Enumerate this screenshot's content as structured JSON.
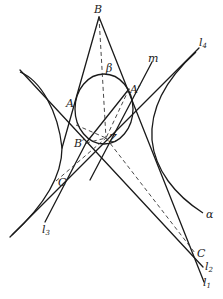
{
  "diagram": {
    "type": "projective-geometry-conic-tangents",
    "points": {
      "B": {
        "label": "B",
        "x": 99,
        "y": 17
      },
      "A": {
        "label": "A",
        "x": 77,
        "y": 103
      },
      "beta": {
        "label": "β",
        "x": 108,
        "y": 74
      },
      "A_prime": {
        "label": "A′",
        "x": 129,
        "y": 89
      },
      "B_prime": {
        "label": "B′",
        "x": 86,
        "y": 143
      },
      "Z": {
        "label": "Z",
        "x": 106,
        "y": 138
      },
      "C_prime": {
        "label": "C′",
        "x": 56,
        "y": 181
      },
      "C": {
        "label": "C",
        "x": 195,
        "y": 253
      }
    },
    "lines": {
      "m": {
        "label": "m"
      },
      "l1": {
        "label": "l",
        "sub": "1"
      },
      "l2": {
        "label": "l",
        "sub": "2"
      },
      "l3": {
        "label": "l",
        "sub": "3"
      },
      "l4": {
        "label": "l",
        "sub": "4"
      }
    },
    "conics": {
      "alpha": {
        "label": "α"
      },
      "beta": {
        "label": "β"
      }
    },
    "colors": {
      "stroke": "#1a1a1a",
      "background": "#ffffff"
    }
  }
}
